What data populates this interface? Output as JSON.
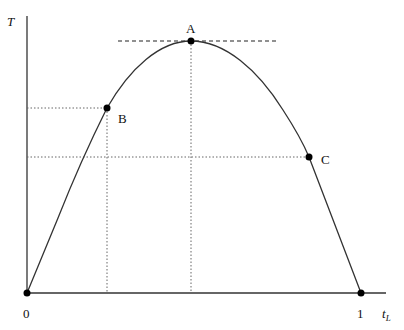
{
  "diagram": {
    "axes": {
      "y_label": "T",
      "x_label_main": "t",
      "x_label_sub": "L",
      "x_ticks": [
        {
          "label": "0"
        },
        {
          "label": "1"
        }
      ]
    },
    "points": [
      {
        "id": "A",
        "label": "A",
        "description": "maximum of curve, horizontal tangent"
      },
      {
        "id": "B",
        "label": "B"
      },
      {
        "id": "C",
        "label": "C"
      }
    ],
    "curve": {
      "shape": "inverted parabola-like hump from 0 to 1",
      "peak": "A"
    },
    "colors": {
      "line": "#333333",
      "point": "#000000",
      "guide": "#666666"
    }
  }
}
